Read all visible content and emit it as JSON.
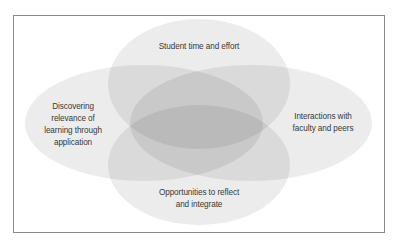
{
  "diagram": {
    "type": "four-circle-venn",
    "circles": [
      {
        "id": "top",
        "label": "Student time and effort"
      },
      {
        "id": "left",
        "label": "Discovering\nrelevance of\nlearning through\napplication"
      },
      {
        "id": "right",
        "label": "Interactions with\nfaculty and peers"
      },
      {
        "id": "bottom",
        "label": "Opportunities to reflect\nand integrate"
      }
    ]
  },
  "colors": {
    "background": "#ffffff",
    "frame_border": "#8a8a8a",
    "ellipse_fill": "#000000",
    "ellipse_opacity": 0.075,
    "text": "#3a3a3a"
  }
}
